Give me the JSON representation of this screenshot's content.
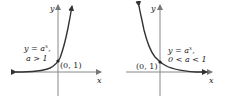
{
  "panels": [
    {
      "id": "growth",
      "axis_x_label": "x",
      "axis_y_label": "y",
      "equation": "y = a",
      "exponent": "x",
      "equation_suffix": ",",
      "condition": "a > 1",
      "point_label": "(0, 1)"
    },
    {
      "id": "decay",
      "axis_x_label": "x",
      "axis_y_label": "y",
      "equation": "y = a",
      "exponent": "x",
      "equation_suffix": ",",
      "condition": "0 < a < 1",
      "point_label": "(0, 1)"
    }
  ],
  "colors": {
    "axis": "#888888",
    "curve": "#333333",
    "text": "#222222"
  }
}
